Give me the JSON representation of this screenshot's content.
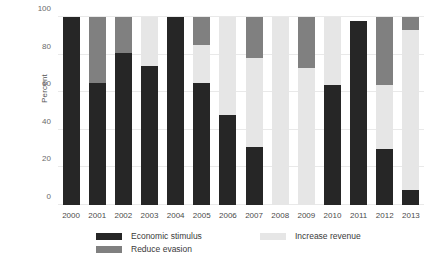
{
  "chart_data": {
    "type": "bar",
    "stacked": true,
    "title": "",
    "subtitle": "",
    "xlabel": "",
    "ylabel": "Percent",
    "ylim": [
      0,
      100
    ],
    "yticks": [
      0,
      20,
      40,
      60,
      80,
      100
    ],
    "grid": true,
    "legend_position": "bottom",
    "categories": [
      "2000",
      "2001",
      "2002",
      "2003",
      "2004",
      "2005",
      "2006",
      "2007",
      "2008",
      "2009",
      "2010",
      "2011",
      "2012",
      "2013"
    ],
    "series": [
      {
        "name": "Economic stimulus",
        "color": "#262626",
        "values": [
          100,
          65,
          81,
          74,
          100,
          65,
          48,
          31,
          0,
          0,
          64,
          98,
          30,
          8
        ]
      },
      {
        "name": "Increase revenue",
        "color": "#e6e6e6",
        "values": [
          0,
          0,
          0,
          26,
          0,
          20,
          52,
          47,
          100,
          73,
          36,
          0,
          34,
          85
        ]
      },
      {
        "name": "Reduce evasion",
        "color": "#808080",
        "values": [
          0,
          35,
          19,
          0,
          0,
          15,
          0,
          22,
          0,
          27,
          0,
          0,
          36,
          7
        ]
      }
    ],
    "series_order_bottom_to_top": [
      "Economic stimulus",
      "Increase revenue",
      "Reduce evasion"
    ]
  },
  "colors": {
    "economic_stimulus": "#262626",
    "increase_revenue": "#e6e6e6",
    "reduce_evasion": "#808080",
    "gridline": "#e9e9e9",
    "tick_text": "#6a6a6a",
    "background": "#ffffff"
  },
  "legend": {
    "items": [
      {
        "label": "Economic stimulus",
        "color": "#262626"
      },
      {
        "label": "Reduce evasion",
        "color": "#808080"
      },
      {
        "label": "Increase revenue",
        "color": "#e6e6e6"
      }
    ]
  }
}
